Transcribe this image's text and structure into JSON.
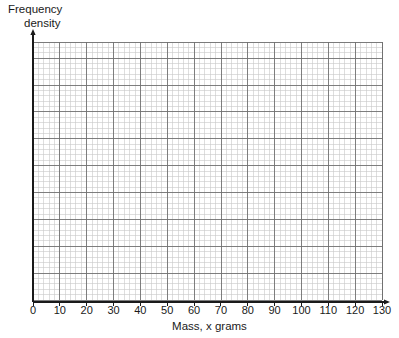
{
  "chart_data": {
    "type": "grid",
    "title": "",
    "xlabel": "Mass, x grams",
    "ylabel": "Frequency density",
    "ylabel_line1": "Frequency",
    "ylabel_line2": "density",
    "xlim": [
      0,
      130
    ],
    "ylim": [
      0,
      96
    ],
    "x_tick_labels": [
      "0",
      "10",
      "20",
      "30",
      "40",
      "50",
      "60",
      "70",
      "80",
      "90",
      "100",
      "110",
      "120",
      "130"
    ],
    "x_tick_values": [
      0,
      10,
      20,
      30,
      40,
      50,
      60,
      70,
      80,
      90,
      100,
      110,
      120,
      130
    ],
    "y_tick_labels": [],
    "y_tick_values": [],
    "series": [],
    "values": [],
    "categories": [],
    "grid": {
      "visible": true,
      "minor_per_major": 5,
      "major_spacing_units": 10,
      "minor_color": "#c8c8c8",
      "major_color": "#707070",
      "background": "#ffffff"
    },
    "axes": {
      "line_color": "#1a1a1a",
      "has_arrow_x": true,
      "has_arrow_y": true,
      "x_axis_label_position": "below",
      "y_axis_label_position": "top-left"
    },
    "annotations": [],
    "legend": {
      "visible": false,
      "entries": []
    },
    "note": "Blank graph paper grid for plotting a frequency density histogram; no data plotted."
  },
  "geometry": {
    "plot_left": 33,
    "plot_right": 382,
    "plot_top": 42,
    "plot_bottom": 300,
    "axis_y": 302,
    "axis_x": 33,
    "minor_step": 5.373,
    "major_step": 26.846,
    "cols_minor": 65,
    "rows_minor": 48,
    "tick_label_y": 314,
    "arrow_x_end": 390,
    "arrow_y_end": 29
  },
  "colors": {
    "background": "#ffffff",
    "text": "#1a1a1a",
    "grid_minor": "#c8c8c8",
    "grid_major": "#707070",
    "axis": "#1a1a1a"
  }
}
